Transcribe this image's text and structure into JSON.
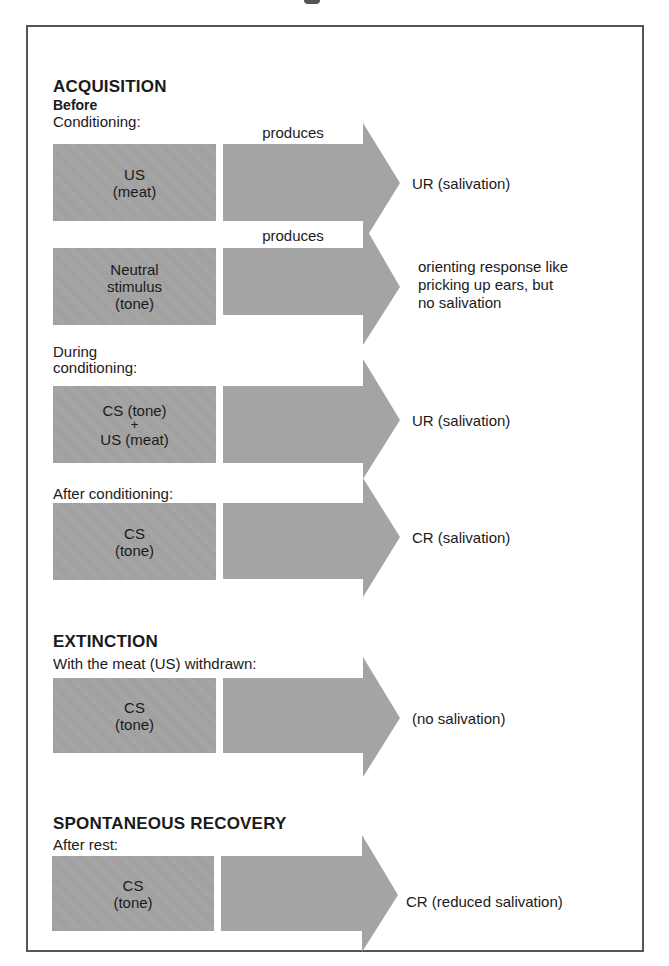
{
  "diagram": {
    "colors": {
      "box_fill": "#a4a4a4",
      "frame": "#555555",
      "text": "#1a1a1a"
    },
    "acquisition": {
      "title": "ACQUISITION",
      "before": {
        "label_line1": "Before",
        "label_line2": "Conditioning:",
        "rows": [
          {
            "stimulus": [
              "US",
              "(meat)"
            ],
            "connector": "produces",
            "result": [
              "UR (salivation)"
            ]
          },
          {
            "stimulus": [
              "Neutral",
              "stimulus",
              "(tone)"
            ],
            "connector": "produces",
            "result": [
              "orienting response like",
              "pricking up ears, but",
              "no salivation"
            ]
          }
        ]
      },
      "during": {
        "label_line1": "During",
        "label_line2": "conditioning:",
        "stimulus": [
          "CS (tone)",
          "+",
          "US (meat)"
        ],
        "result": [
          "UR (salivation)"
        ]
      },
      "after": {
        "label": "After conditioning:",
        "stimulus": [
          "CS",
          "(tone)"
        ],
        "result": [
          "CR (salivation)"
        ]
      }
    },
    "extinction": {
      "title": "EXTINCTION",
      "label": "With the meat (US) withdrawn:",
      "stimulus": [
        "CS",
        "(tone)"
      ],
      "result": [
        "(no salivation)"
      ]
    },
    "spontaneous_recovery": {
      "title": "SPONTANEOUS RECOVERY",
      "label": "After rest:",
      "stimulus": [
        "CS",
        "(tone)"
      ],
      "result": [
        "CR (reduced salivation)"
      ]
    }
  }
}
